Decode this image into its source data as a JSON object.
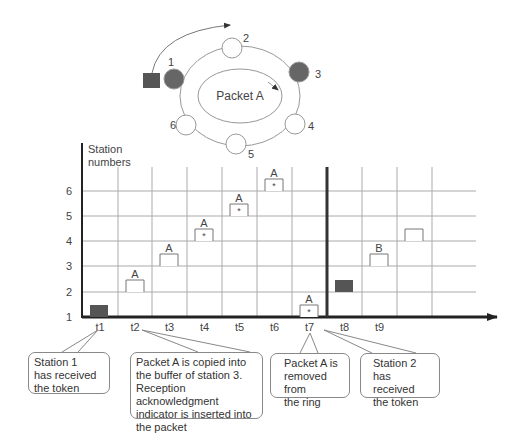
{
  "ring": {
    "center_label": "Packet A",
    "stations": [
      {
        "id": "1",
        "label": "1",
        "cx": 174,
        "cy": 79,
        "filled": true,
        "lx": 168,
        "ly": 66
      },
      {
        "id": "2",
        "label": "2",
        "cx": 232,
        "cy": 48,
        "filled": false,
        "lx": 243,
        "ly": 42
      },
      {
        "id": "3",
        "label": "3",
        "cx": 299,
        "cy": 72,
        "filled": true,
        "lx": 315,
        "ly": 78
      },
      {
        "id": "4",
        "label": "4",
        "cx": 295,
        "cy": 124,
        "filled": false,
        "lx": 308,
        "ly": 130
      },
      {
        "id": "5",
        "label": "5",
        "cx": 236,
        "cy": 144,
        "filled": false,
        "lx": 248,
        "ly": 158
      },
      {
        "id": "6",
        "label": "6",
        "cx": 186,
        "cy": 125,
        "filled": false,
        "lx": 170,
        "ly": 129
      }
    ],
    "colors": {
      "filled": "#666666",
      "stroke": "#999999",
      "token": "#555555"
    }
  },
  "timeline": {
    "y_axis_label_line1": "Station",
    "y_axis_label_line2": "numbers",
    "y_ticks": [
      "1",
      "2",
      "3",
      "4",
      "5",
      "6"
    ],
    "x_ticks": [
      "t1",
      "t2",
      "t3",
      "t4",
      "t5",
      "t6",
      "t7",
      "t8",
      "t9"
    ],
    "packets": [
      {
        "time": "t2",
        "station": 2,
        "label": "A",
        "ack": false
      },
      {
        "time": "t3",
        "station": 3,
        "label": "A",
        "ack": false
      },
      {
        "time": "t4",
        "station": 4,
        "label": "A",
        "ack": true
      },
      {
        "time": "t5",
        "station": 5,
        "label": "A",
        "ack": true
      },
      {
        "time": "t6",
        "station": 6,
        "label": "A",
        "ack": true
      },
      {
        "time": "t7",
        "station": 1,
        "label": "A",
        "ack": true
      },
      {
        "time": "t9",
        "station": 3,
        "label": "B",
        "ack": false
      },
      {
        "time": "t10",
        "station": 4,
        "label": "",
        "ack": false
      }
    ],
    "tokens": [
      {
        "time": "t1",
        "station": 1
      },
      {
        "time": "t8",
        "station": 2
      }
    ],
    "ack_marker": "*"
  },
  "callouts": [
    {
      "id": "t1",
      "text_lines": [
        "Station 1",
        "has received",
        "the token"
      ]
    },
    {
      "id": "t3",
      "text_lines": [
        "Packet A is copied into",
        "the buffer of station 3.",
        "Reception acknowledgment",
        "indicator is inserted into",
        "the packet"
      ]
    },
    {
      "id": "t7",
      "text_lines": [
        "Packet A is",
        "removed from",
        "the ring"
      ]
    },
    {
      "id": "t8",
      "text_lines": [
        "Station 2",
        "has received",
        "the token"
      ]
    }
  ]
}
